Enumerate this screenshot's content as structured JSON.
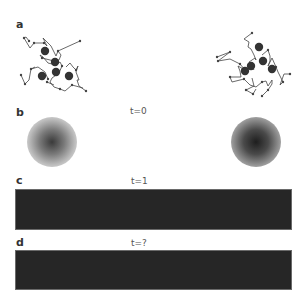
{
  "panels": {
    "a": {
      "label": "a"
    },
    "b": {
      "label": "b",
      "time": "t=0"
    },
    "c": {
      "label": "c",
      "time": "t=1"
    },
    "d": {
      "label": "d",
      "time": "t=?"
    }
  },
  "colors": {
    "background": "#ffffff",
    "ink": "#333333",
    "bar_fill": "#262626",
    "blob_left_center": "#3a3a3a",
    "blob_right_center": "#1e1e1e"
  }
}
